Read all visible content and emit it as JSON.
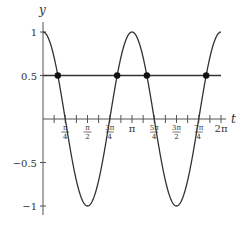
{
  "chart_data": {
    "type": "line",
    "title": "",
    "xlabel": "t",
    "ylabel": "y",
    "xlim": [
      0,
      6.2832
    ],
    "ylim": [
      -1,
      1
    ],
    "grid": false,
    "legend": null,
    "series": [
      {
        "name": "y = cos(2t)",
        "function": "cos(2t)",
        "x": [
          0,
          0.3927,
          0.7854,
          1.1781,
          1.5708,
          1.9635,
          2.3562,
          2.7489,
          3.1416,
          3.5343,
          3.927,
          4.3197,
          4.7124,
          5.1051,
          5.4978,
          5.8905,
          6.2832
        ],
        "values": [
          1,
          0.7071,
          0,
          -0.7071,
          -1,
          -0.7071,
          0,
          0.7071,
          1,
          0.7071,
          0,
          -0.7071,
          -1,
          -0.7071,
          0,
          0.7071,
          1
        ],
        "color": "#333333"
      },
      {
        "name": "y = 0.5",
        "x": [
          0,
          6.2832
        ],
        "values": [
          0.5,
          0.5
        ],
        "color": "#333333"
      }
    ],
    "points": [
      {
        "x": 0.5236,
        "y": 0.5,
        "label": "π/6"
      },
      {
        "x": 2.618,
        "y": 0.5,
        "label": "5π/6"
      },
      {
        "x": 3.6652,
        "y": 0.5,
        "label": "7π/6"
      },
      {
        "x": 5.7596,
        "y": 0.5,
        "label": "11π/6"
      }
    ],
    "x_ticks_minor_step": "π/8",
    "x_tick_labels": [
      {
        "num": "π",
        "den": "4",
        "value": 0.7854
      },
      {
        "num": "π",
        "den": "2",
        "value": 1.5708
      },
      {
        "num": "3π",
        "den": "4",
        "value": 2.3562
      },
      {
        "text": "π",
        "value": 3.1416
      },
      {
        "num": "5π",
        "den": "4",
        "value": 3.927
      },
      {
        "num": "3π",
        "den": "2",
        "value": 4.7124
      },
      {
        "num": "7π",
        "den": "4",
        "value": 5.4978
      },
      {
        "text": "2π",
        "value": 6.2832
      }
    ],
    "y_tick_labels": [
      {
        "text": "1",
        "value": 1
      },
      {
        "text": "0.5",
        "value": 0.5
      },
      {
        "text": "−0.5",
        "value": -0.5
      },
      {
        "text": "−1",
        "value": -1
      }
    ]
  }
}
